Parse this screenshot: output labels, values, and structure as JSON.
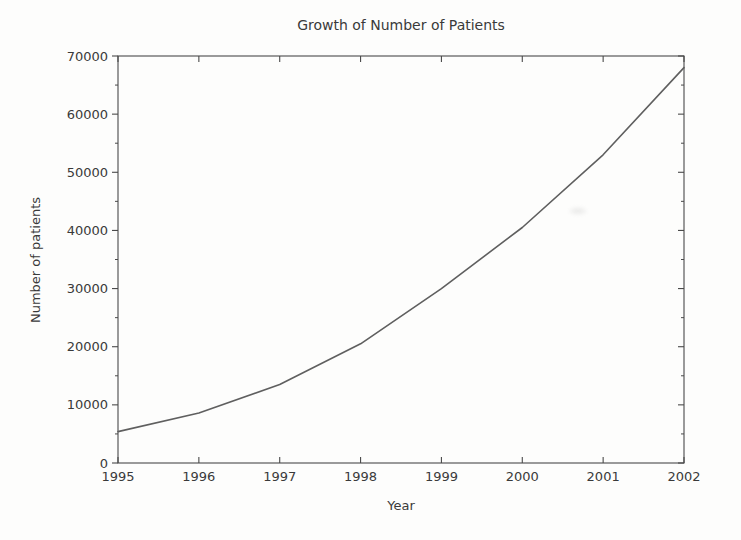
{
  "chart_data": {
    "type": "line",
    "title": "Growth of Number of Patients",
    "xlabel": "Year",
    "ylabel": "Number of patients",
    "x": [
      1995,
      1996,
      1997,
      1998,
      1999,
      2000,
      2001,
      2002
    ],
    "series": [
      {
        "name": "Number of patients",
        "values": [
          5400,
          8600,
          13500,
          20500,
          30000,
          40500,
          53000,
          68000
        ]
      }
    ],
    "xlim": [
      1995,
      2002
    ],
    "ylim": [
      0,
      70000
    ],
    "ytick_step": 10000,
    "ytick_minor_step": 5000,
    "xtick_step": 1,
    "ytick_labels": [
      "0",
      "10000",
      "20000",
      "30000",
      "40000",
      "50000",
      "60000",
      "70000"
    ],
    "xtick_labels": [
      "1995",
      "1996",
      "1997",
      "1998",
      "1999",
      "2000",
      "2001",
      "2002"
    ],
    "grid": false,
    "legend": "none",
    "frame": "box",
    "line_color": "#5f5f5f",
    "axis_color": "#4a4a4a",
    "text_color": "#3a3a3a",
    "background_color": "#fdfdfc"
  }
}
